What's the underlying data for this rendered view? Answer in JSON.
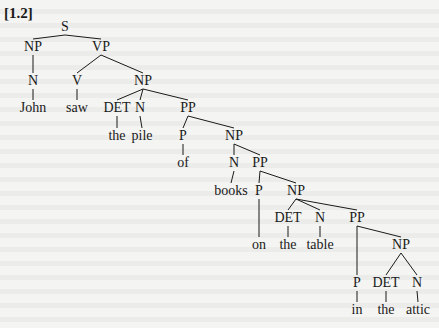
{
  "figure": {
    "label": "[1.2]",
    "nodes": [
      {
        "id": "S",
        "label": "S",
        "x": 65,
        "y": 27,
        "type": "category"
      },
      {
        "id": "NP1",
        "label": "NP",
        "x": 33,
        "y": 47,
        "type": "category"
      },
      {
        "id": "VP",
        "label": "VP",
        "x": 101,
        "y": 47,
        "type": "category"
      },
      {
        "id": "N1",
        "label": "N",
        "x": 33,
        "y": 81,
        "type": "category"
      },
      {
        "id": "V",
        "label": "V",
        "x": 77,
        "y": 81,
        "type": "category"
      },
      {
        "id": "NP2",
        "label": "NP",
        "x": 143,
        "y": 81,
        "type": "category"
      },
      {
        "id": "John",
        "label": "John",
        "x": 33,
        "y": 108,
        "type": "word"
      },
      {
        "id": "saw",
        "label": "saw",
        "x": 77,
        "y": 108,
        "type": "word"
      },
      {
        "id": "DET1",
        "label": "DET",
        "x": 117,
        "y": 108,
        "type": "category"
      },
      {
        "id": "N2",
        "label": "N",
        "x": 140,
        "y": 108,
        "type": "category"
      },
      {
        "id": "PP1",
        "label": "PP",
        "x": 188,
        "y": 108,
        "type": "category"
      },
      {
        "id": "the1",
        "label": "the",
        "x": 117,
        "y": 136,
        "type": "word"
      },
      {
        "id": "pile",
        "label": "pile",
        "x": 142,
        "y": 136,
        "type": "word"
      },
      {
        "id": "P1",
        "label": "P",
        "x": 183,
        "y": 136,
        "type": "category"
      },
      {
        "id": "NP3",
        "label": "NP",
        "x": 234,
        "y": 136,
        "type": "category"
      },
      {
        "id": "of",
        "label": "of",
        "x": 183,
        "y": 163,
        "type": "word"
      },
      {
        "id": "N3",
        "label": "N",
        "x": 234,
        "y": 163,
        "type": "category"
      },
      {
        "id": "PP2",
        "label": "PP",
        "x": 260,
        "y": 163,
        "type": "category"
      },
      {
        "id": "books",
        "label": "books",
        "x": 231,
        "y": 191,
        "type": "word"
      },
      {
        "id": "P2",
        "label": "P",
        "x": 259,
        "y": 191,
        "type": "category"
      },
      {
        "id": "NP4",
        "label": "NP",
        "x": 296,
        "y": 191,
        "type": "category"
      },
      {
        "id": "DET2",
        "label": "DET",
        "x": 288,
        "y": 218,
        "type": "category"
      },
      {
        "id": "N4",
        "label": "N",
        "x": 320,
        "y": 218,
        "type": "category"
      },
      {
        "id": "PP3",
        "label": "PP",
        "x": 357,
        "y": 218,
        "type": "category"
      },
      {
        "id": "on",
        "label": "on",
        "x": 259,
        "y": 245,
        "type": "word"
      },
      {
        "id": "the2",
        "label": "the",
        "x": 288,
        "y": 245,
        "type": "word"
      },
      {
        "id": "table",
        "label": "table",
        "x": 320,
        "y": 245,
        "type": "word"
      },
      {
        "id": "NP5",
        "label": "NP",
        "x": 401,
        "y": 245,
        "type": "category"
      },
      {
        "id": "P3",
        "label": "P",
        "x": 357,
        "y": 283,
        "type": "category"
      },
      {
        "id": "DET3",
        "label": "DET",
        "x": 386,
        "y": 283,
        "type": "category"
      },
      {
        "id": "N5",
        "label": "N",
        "x": 417,
        "y": 283,
        "type": "category"
      },
      {
        "id": "in",
        "label": "in",
        "x": 357,
        "y": 310,
        "type": "word"
      },
      {
        "id": "the3",
        "label": "the",
        "x": 386,
        "y": 310,
        "type": "word"
      },
      {
        "id": "attic",
        "label": "attic",
        "x": 418,
        "y": 310,
        "type": "word"
      }
    ],
    "edges": [
      [
        "S",
        "NP1"
      ],
      [
        "S",
        "VP"
      ],
      [
        "NP1",
        "N1"
      ],
      [
        "N1",
        "John"
      ],
      [
        "VP",
        "V"
      ],
      [
        "VP",
        "NP2"
      ],
      [
        "V",
        "saw"
      ],
      [
        "NP2",
        "DET1"
      ],
      [
        "NP2",
        "N2"
      ],
      [
        "NP2",
        "PP1"
      ],
      [
        "DET1",
        "the1"
      ],
      [
        "N2",
        "pile"
      ],
      [
        "PP1",
        "P1"
      ],
      [
        "PP1",
        "NP3"
      ],
      [
        "P1",
        "of"
      ],
      [
        "NP3",
        "N3"
      ],
      [
        "NP3",
        "PP2"
      ],
      [
        "N3",
        "books"
      ],
      [
        "PP2",
        "P2"
      ],
      [
        "PP2",
        "NP4"
      ],
      [
        "P2",
        "on"
      ],
      [
        "NP4",
        "DET2"
      ],
      [
        "NP4",
        "N4"
      ],
      [
        "NP4",
        "PP3"
      ],
      [
        "DET2",
        "the2"
      ],
      [
        "N4",
        "table"
      ],
      [
        "PP3",
        "P3"
      ],
      [
        "PP3",
        "NP5"
      ],
      [
        "P3",
        "in"
      ],
      [
        "NP5",
        "DET3"
      ],
      [
        "NP5",
        "N5"
      ],
      [
        "DET3",
        "the3"
      ],
      [
        "N5",
        "attic"
      ]
    ],
    "sentence": "John saw the pile of books on the table in the attic"
  }
}
